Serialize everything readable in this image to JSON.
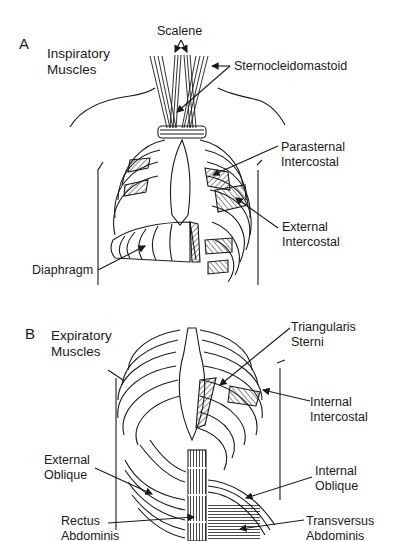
{
  "colors": {
    "ink": "#1a1a1a",
    "background": "#ffffff"
  },
  "panel_a": {
    "letter": "A",
    "title_line1": "Inspiratory",
    "title_line2": "Muscles",
    "labels": {
      "scalene": "Scalene",
      "sternocleidomastoid": "Sternocleidomastoid",
      "parasternal_line1": "Parasternal",
      "parasternal_line2": "Intercostal",
      "external_intercostal_line1": "External",
      "external_intercostal_line2": "Intercostal",
      "diaphragm": "Diaphragm"
    }
  },
  "panel_b": {
    "letter": "B",
    "title_line1": "Expiratory",
    "title_line2": "Muscles",
    "labels": {
      "triangularis_line1": "Triangularis",
      "triangularis_line2": "Sterni",
      "internal_intercostal_line1": "Internal",
      "internal_intercostal_line2": "Intercostal",
      "external_oblique_line1": "External",
      "external_oblique_line2": "Oblique",
      "internal_oblique_line1": "Internal",
      "internal_oblique_line2": "Oblique",
      "rectus_line1": "Rectus",
      "rectus_line2": "Abdominis",
      "transversus_line1": "Transversus",
      "transversus_line2": "Abdominis"
    }
  }
}
